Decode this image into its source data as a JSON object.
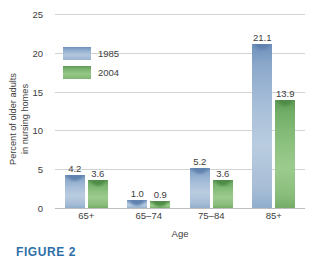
{
  "chart_data": {
    "type": "bar",
    "title": "",
    "subtitle": "",
    "xlabel": "Age",
    "ylabel_line1": "Percent of older adults",
    "ylabel_line2": "in nursing homes",
    "categories": [
      "65+",
      "65–74",
      "75–84",
      "85+"
    ],
    "series": [
      {
        "name": "1985",
        "color": "#8aa7ca",
        "values": [
          4.2,
          1.0,
          5.2,
          21.1
        ]
      },
      {
        "name": "2004",
        "color": "#76b16b",
        "values": [
          3.6,
          0.9,
          3.6,
          13.9
        ]
      }
    ],
    "value_labels": {
      "s0": [
        "4.2",
        "1.0",
        "5.2",
        "21.1"
      ],
      "s1": [
        "3.6",
        "0.9",
        "3.6",
        "13.9"
      ]
    },
    "ylim": [
      0,
      25
    ],
    "yticks": [
      25,
      20,
      15,
      10,
      5,
      0
    ],
    "ytick_labels": [
      "25",
      "20",
      "15",
      "10",
      "5",
      "0"
    ],
    "grid": true,
    "grid_color": "#d3d3d3",
    "legend_position": "inside-upper-left",
    "axis_color": "#bdbdbd"
  },
  "legend": {
    "items": [
      {
        "label": "1985",
        "swatch": "blue-swatch"
      },
      {
        "label": "2004",
        "swatch": "green-swatch"
      }
    ]
  },
  "caption": {
    "text": "FIGURE 2"
  }
}
